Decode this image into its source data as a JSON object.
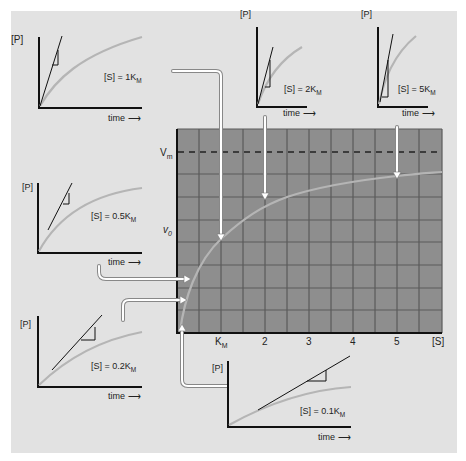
{
  "colors": {
    "background": "#e2e2e2",
    "grid_fill": "#8e8e8e",
    "grid_line": "#5a5a5a",
    "curve": "#b5b5b5",
    "axis": "#111111",
    "arrow": "#ffffff"
  },
  "main_plot": {
    "y_labels": {
      "vmax": "V",
      "vmax_sub": "m",
      "v0": "v",
      "v0_sub": "0"
    },
    "x_labels": [
      {
        "text": "K",
        "sub": "M"
      },
      {
        "text": "2",
        "sub": ""
      },
      {
        "text": "3",
        "sub": ""
      },
      {
        "text": "4",
        "sub": ""
      },
      {
        "text": "5",
        "sub": ""
      },
      {
        "text": "[S]",
        "sub": ""
      }
    ]
  },
  "panels": [
    {
      "id": "s1",
      "y_label": "[P]",
      "x_label": "time ⟶",
      "conc_prefix": "[S] = 1K",
      "conc_sub": "M"
    },
    {
      "id": "s2",
      "y_label": "[P]",
      "x_label": "time ⟶",
      "conc_prefix": "[S] = 2K",
      "conc_sub": "M"
    },
    {
      "id": "s5",
      "y_label": "[P]",
      "x_label": "time ⟶",
      "conc_prefix": "[S] = 5K",
      "conc_sub": "M"
    },
    {
      "id": "s05",
      "y_label": "[P]",
      "x_label": "time ⟶",
      "conc_prefix": "[S] = 0.5K",
      "conc_sub": "M"
    },
    {
      "id": "s02",
      "y_label": "[P]",
      "x_label": "time ⟶",
      "conc_prefix": "[S] = 0.2K",
      "conc_sub": "M"
    },
    {
      "id": "s01",
      "y_label": "[P]",
      "x_label": "time ⟶",
      "conc_prefix": "[S] = 0.1K",
      "conc_sub": "M"
    }
  ]
}
